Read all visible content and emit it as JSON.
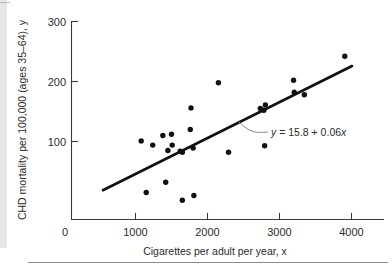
{
  "figure": {
    "name": "chd-mortality-vs-cigarettes-scatterplot",
    "background_color": "#ffffff",
    "ink_color": "#111111",
    "left_strip_color": "#e6e6e6"
  },
  "chart_data": {
    "type": "scatter",
    "title": "",
    "xlabel": "Cigarettes per adult per year, x",
    "ylabel": "CHD mortality per 100,000 (ages 35–64), y",
    "xlim": [
      0,
      4250
    ],
    "ylim": [
      0,
      312
    ],
    "xticks": [
      0,
      1000,
      2000,
      3000,
      4000
    ],
    "xtick_labels": [
      "0",
      "1000",
      "2000",
      "3000",
      "4000"
    ],
    "yticks": [
      100,
      200,
      300
    ],
    "ytick_labels": [
      "100",
      "200",
      "300"
    ],
    "grid": false,
    "legend": null,
    "marker": "filled-circle",
    "points": [
      {
        "x": 1080,
        "y": 131
      },
      {
        "x": 1240,
        "y": 124
      },
      {
        "x": 1380,
        "y": 140
      },
      {
        "x": 1450,
        "y": 115
      },
      {
        "x": 1500,
        "y": 142
      },
      {
        "x": 1510,
        "y": 124
      },
      {
        "x": 1620,
        "y": 114
      },
      {
        "x": 1650,
        "y": 112
      },
      {
        "x": 1800,
        "y": 119
      },
      {
        "x": 1770,
        "y": 186
      },
      {
        "x": 1760,
        "y": 150
      },
      {
        "x": 2150,
        "y": 228
      },
      {
        "x": 2290,
        "y": 112
      },
      {
        "x": 2730,
        "y": 185
      },
      {
        "x": 2780,
        "y": 182
      },
      {
        "x": 2800,
        "y": 191
      },
      {
        "x": 2790,
        "y": 123
      },
      {
        "x": 3190,
        "y": 232
      },
      {
        "x": 3200,
        "y": 212
      },
      {
        "x": 3340,
        "y": 208
      },
      {
        "x": 3900,
        "y": 272
      },
      {
        "x": 1150,
        "y": 45
      },
      {
        "x": 1420,
        "y": 62
      },
      {
        "x": 1650,
        "y": 32
      },
      {
        "x": 1810,
        "y": 40
      }
    ],
    "regression": {
      "equation_label": "y = 15.8 + 0.06x",
      "intercept": 15.8,
      "slope": 0.06,
      "x_start": 550,
      "x_end": 4000,
      "annotation_anchor": {
        "x": 2420,
        "y": 160
      }
    }
  }
}
